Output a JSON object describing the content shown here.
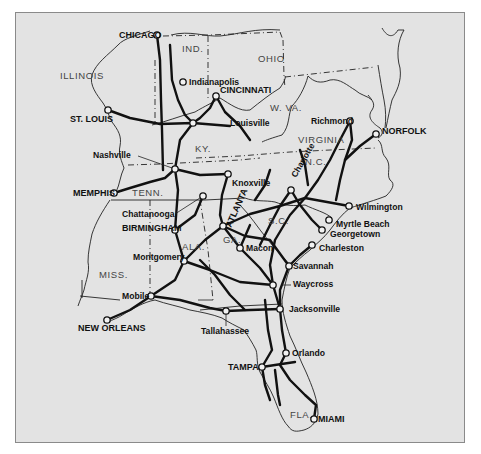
{
  "map": {
    "title": "Southeastern U.S. rail network",
    "colors": {
      "background": "#e3e3e3",
      "outer": "#ffffff",
      "rail": "#111111",
      "border": "#222222",
      "frame": "#8a8a8a"
    },
    "states": [
      {
        "id": "illinois",
        "label": "ILLINOIS",
        "x": 60,
        "y": 79
      },
      {
        "id": "indiana",
        "label": "IND.",
        "x": 182,
        "y": 52
      },
      {
        "id": "ohio",
        "label": "OHIO",
        "x": 258,
        "y": 62
      },
      {
        "id": "west-virginia",
        "label": "W. VA.",
        "x": 270,
        "y": 111
      },
      {
        "id": "virginia",
        "label": "VIRGINIA",
        "x": 298,
        "y": 143
      },
      {
        "id": "kentucky",
        "label": "KY.",
        "x": 195,
        "y": 152
      },
      {
        "id": "tennessee",
        "label": "TENN.",
        "x": 132,
        "y": 196
      },
      {
        "id": "north-carolina",
        "label": "N.C.",
        "x": 305,
        "y": 165
      },
      {
        "id": "south-carolina",
        "label": "S.C.",
        "x": 268,
        "y": 224
      },
      {
        "id": "georgia",
        "label": "GA.",
        "x": 223,
        "y": 243
      },
      {
        "id": "alabama",
        "label": "ALA.",
        "x": 182,
        "y": 250
      },
      {
        "id": "mississippi",
        "label": "MISS.",
        "x": 99,
        "y": 278
      },
      {
        "id": "florida",
        "label": "FLA.",
        "x": 290,
        "y": 418
      }
    ],
    "cities": [
      {
        "id": "chicago",
        "label": "CHICAGO",
        "x": 157,
        "y": 35,
        "major": true,
        "lx": 119,
        "ly": 38,
        "anchor": "start"
      },
      {
        "id": "indianapolis",
        "label": "Indianapolis",
        "x": 183,
        "y": 82,
        "major": false,
        "lx": 189,
        "ly": 85,
        "anchor": "start"
      },
      {
        "id": "cincinnati",
        "label": "CINCINNATI",
        "x": 216,
        "y": 96,
        "major": true,
        "lx": 220,
        "ly": 93,
        "anchor": "start"
      },
      {
        "id": "st-louis",
        "label": "ST. LOUIS",
        "x": 108,
        "y": 110,
        "major": true,
        "lx": 70,
        "ly": 122,
        "anchor": "start"
      },
      {
        "id": "louisville",
        "label": "Louisville",
        "x": 193,
        "y": 123,
        "major": false,
        "lx": 230,
        "ly": 126,
        "anchor": "start"
      },
      {
        "id": "richmond",
        "label": "Richmond",
        "x": 350,
        "y": 121,
        "major": false,
        "lx": 311,
        "ly": 124,
        "anchor": "start"
      },
      {
        "id": "norfolk",
        "label": "NORFOLK",
        "x": 376,
        "y": 134,
        "major": true,
        "lx": 382,
        "ly": 134,
        "anchor": "start"
      },
      {
        "id": "nashville",
        "label": "Nashville",
        "x": 175,
        "y": 169,
        "major": false,
        "lx": 93,
        "ly": 158,
        "anchor": "start"
      },
      {
        "id": "knoxville",
        "label": "Knoxville",
        "x": 228,
        "y": 174,
        "major": false,
        "lx": 232,
        "ly": 186,
        "anchor": "start"
      },
      {
        "id": "charlotte",
        "label": "Charlotte",
        "x": 291,
        "y": 190,
        "major": false,
        "lx": 296,
        "ly": 178,
        "anchor": "start",
        "rotate": -60
      },
      {
        "id": "memphis",
        "label": "MEMPHIS",
        "x": 114,
        "y": 193,
        "major": true,
        "lx": 73,
        "ly": 196,
        "anchor": "start"
      },
      {
        "id": "chattanooga",
        "label": "Chattanooga",
        "x": 203,
        "y": 196,
        "major": false,
        "lx": 122,
        "ly": 217,
        "anchor": "start"
      },
      {
        "id": "atlanta",
        "label": "ATLANTA",
        "x": 223,
        "y": 226,
        "major": true,
        "lx": 231,
        "ly": 228,
        "anchor": "start",
        "rotate": -66
      },
      {
        "id": "wilmington",
        "label": "Wilmington",
        "x": 349,
        "y": 206,
        "major": false,
        "lx": 356,
        "ly": 210,
        "anchor": "start"
      },
      {
        "id": "birmingham",
        "label": "BIRMINGHAM",
        "x": 175,
        "y": 230,
        "major": true,
        "lx": 122,
        "ly": 231,
        "anchor": "start"
      },
      {
        "id": "myrtle-beach",
        "label": "Myrtle Beach",
        "x": 329,
        "y": 220,
        "major": false,
        "lx": 336,
        "ly": 227,
        "anchor": "start"
      },
      {
        "id": "georgetown",
        "label": "Georgetown",
        "x": 322,
        "y": 230,
        "major": false,
        "lx": 330,
        "ly": 237,
        "anchor": "start"
      },
      {
        "id": "macon",
        "label": "Macon",
        "x": 240,
        "y": 248,
        "major": false,
        "lx": 246,
        "ly": 251,
        "anchor": "start"
      },
      {
        "id": "charleston",
        "label": "Charleston",
        "x": 312,
        "y": 245,
        "major": false,
        "lx": 319,
        "ly": 251,
        "anchor": "start"
      },
      {
        "id": "montgomery",
        "label": "Montgomery",
        "x": 184,
        "y": 261,
        "major": false,
        "lx": 133,
        "ly": 260,
        "anchor": "start"
      },
      {
        "id": "savannah",
        "label": "Savannah",
        "x": 289,
        "y": 266,
        "major": false,
        "lx": 293,
        "ly": 269,
        "anchor": "start"
      },
      {
        "id": "waycross",
        "label": "Waycross",
        "x": 273,
        "y": 285,
        "major": false,
        "lx": 293,
        "ly": 287,
        "anchor": "start"
      },
      {
        "id": "mobile",
        "label": "Mobile",
        "x": 151,
        "y": 296,
        "major": false,
        "lx": 122,
        "ly": 299,
        "anchor": "start"
      },
      {
        "id": "new-orleans",
        "label": "NEW ORLEANS",
        "x": 107,
        "y": 320,
        "major": true,
        "lx": 78,
        "ly": 331,
        "anchor": "start"
      },
      {
        "id": "jacksonville",
        "label": "Jacksonville",
        "x": 280,
        "y": 309,
        "major": false,
        "lx": 289,
        "ly": 312,
        "anchor": "start"
      },
      {
        "id": "tallahassee",
        "label": "Tallahassee",
        "x": 226,
        "y": 311,
        "major": false,
        "lx": 201,
        "ly": 334,
        "anchor": "start"
      },
      {
        "id": "orlando",
        "label": "Orlando",
        "x": 286,
        "y": 353,
        "major": false,
        "lx": 292,
        "ly": 356,
        "anchor": "start"
      },
      {
        "id": "tampa",
        "label": "TAMPA",
        "x": 262,
        "y": 367,
        "major": true,
        "lx": 228,
        "ly": 370,
        "anchor": "start"
      },
      {
        "id": "miami",
        "label": "MIAMI",
        "x": 314,
        "y": 419,
        "major": true,
        "lx": 318,
        "ly": 422,
        "anchor": "start"
      }
    ]
  }
}
